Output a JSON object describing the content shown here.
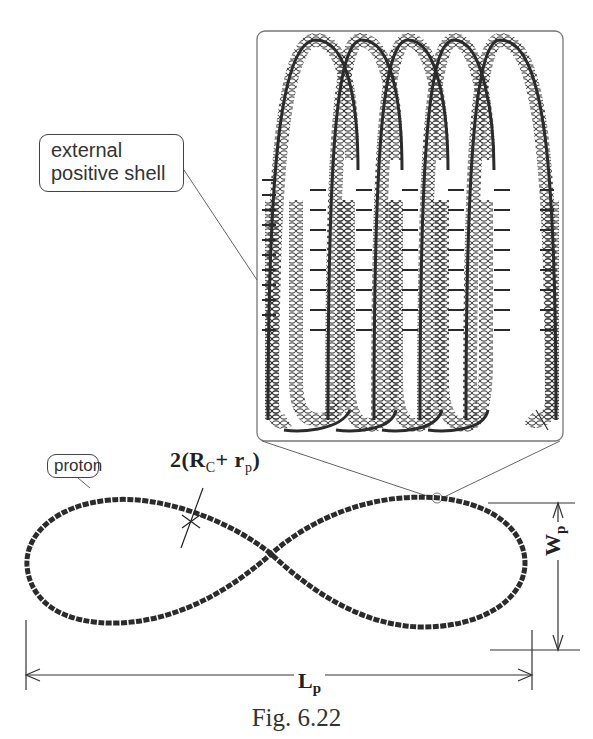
{
  "figure": {
    "caption": "Fig. 6.22",
    "colors": {
      "stroke": "#2b2b2b",
      "thin_line": "#555555",
      "background": "#ffffff"
    },
    "labels": {
      "external_shell_line1": "external",
      "external_shell_line2": "positive shell",
      "proton": "proton",
      "radius_prefix": "2(R",
      "radius_sub_c": "C",
      "radius_mid": "+ r",
      "radius_sub_p": "p",
      "radius_suffix": ")",
      "length_main": "L",
      "length_sub": "p",
      "width_main": "W",
      "width_sub": "p"
    },
    "parts": [
      {
        "name": "magnified-inset",
        "description": "helical structure with 5 coil loops"
      },
      {
        "name": "proton-figure-eight",
        "description": "lemniscate-shaped proton trajectory"
      },
      {
        "name": "length-dimension",
        "label": "Lp"
      },
      {
        "name": "width-dimension",
        "label": "Wp"
      },
      {
        "name": "thickness-marker",
        "label": "2(Rc+ rp)"
      }
    ]
  }
}
